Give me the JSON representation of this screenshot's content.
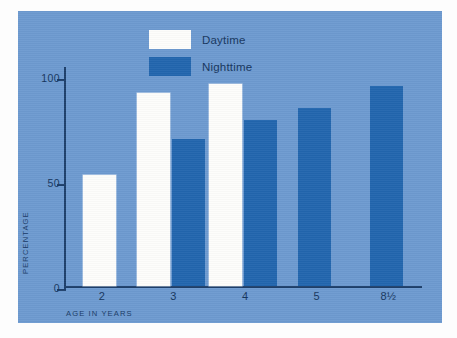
{
  "figure": {
    "panel_color": "#6d9ad0",
    "axis_color": "#1d3f6b"
  },
  "legend": {
    "items": [
      {
        "label": "Daytime",
        "color": "#fdfdfb",
        "swatch_name": "legend-swatch-daytime"
      },
      {
        "label": "Nighttime",
        "color": "#2266ae",
        "swatch_name": "legend-swatch-nighttime"
      }
    ]
  },
  "axes": {
    "ylabel": "PERCENTAGE",
    "xlabel": "AGE IN YEARS",
    "yticks": [
      "0",
      "50",
      "100"
    ]
  },
  "chart_data": {
    "type": "bar",
    "title": "",
    "xlabel": "AGE IN YEARS",
    "ylabel": "PERCENTAGE",
    "categories": [
      "2",
      "3",
      "4",
      "5",
      "8½"
    ],
    "ylim": [
      0,
      100
    ],
    "yticks": [
      0,
      50,
      100
    ],
    "grid": false,
    "legend_position": "top-center",
    "series": [
      {
        "name": "Daytime",
        "color": "#fdfdfb",
        "values": [
          50,
          87,
          91,
          null,
          null
        ]
      },
      {
        "name": "Nighttime",
        "color": "#2266ae",
        "values": [
          null,
          66,
          75,
          80,
          90
        ]
      }
    ]
  }
}
